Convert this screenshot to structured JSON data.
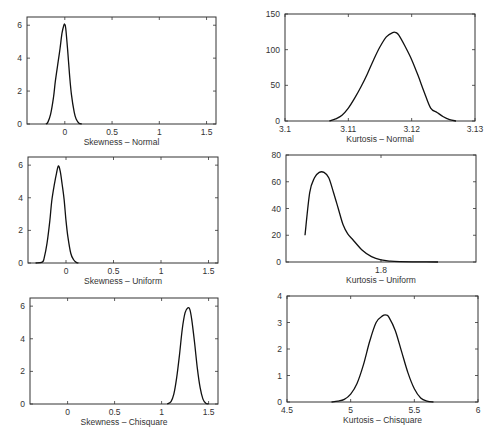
{
  "figure": {
    "layout": {
      "rows": 3,
      "cols": 2
    }
  },
  "chart_data": [
    {
      "type": "line",
      "id": "skew-normal",
      "title": "",
      "xlabel": "Skewness – Normal",
      "ylabel": "",
      "xlim": [
        -0.4,
        1.6
      ],
      "ylim": [
        0,
        6.5
      ],
      "xticks": [
        0,
        0.5,
        1,
        1.5
      ],
      "xtick_labels": [
        "0",
        "0.5",
        "1",
        "1.5"
      ],
      "yticks": [
        0,
        2,
        4,
        6
      ],
      "ytick_labels": [
        "0",
        "2",
        "4",
        "6"
      ],
      "grid": false,
      "frame": {
        "x": 27,
        "y": 17,
        "w": 189,
        "h": 107
      },
      "x": [
        -0.2,
        -0.18,
        -0.15,
        -0.12,
        -0.1,
        -0.07,
        -0.05,
        -0.03,
        -0.01,
        0.0,
        0.01,
        0.03,
        0.05,
        0.07,
        0.1,
        0.12,
        0.15,
        0.18
      ],
      "y": [
        0,
        0.1,
        0.6,
        1.6,
        2.6,
        3.8,
        4.6,
        5.5,
        6.0,
        6.05,
        5.8,
        4.5,
        3.0,
        1.8,
        0.7,
        0.3,
        0.05,
        0
      ]
    },
    {
      "type": "line",
      "id": "kurt-normal",
      "title": "",
      "xlabel": "Kurtosis – Normal",
      "ylabel": "",
      "xlim": [
        3.1,
        3.13
      ],
      "ylim": [
        0,
        150
      ],
      "xticks": [
        3.1,
        3.11,
        3.12,
        3.13
      ],
      "xtick_labels": [
        "3.1",
        "3.11",
        "3.12",
        "3.13"
      ],
      "yticks": [
        0,
        50,
        100,
        150
      ],
      "ytick_labels": [
        "0",
        "50",
        "100",
        "150"
      ],
      "grid": false,
      "frame": {
        "x": 285,
        "y": 14,
        "w": 190,
        "h": 107
      },
      "x": [
        3.107,
        3.108,
        3.109,
        3.11,
        3.111,
        3.112,
        3.113,
        3.114,
        3.115,
        3.116,
        3.117,
        3.1175,
        3.118,
        3.119,
        3.12,
        3.121,
        3.122,
        3.123,
        3.124,
        3.125,
        3.126,
        3.127
      ],
      "y": [
        0,
        3,
        8,
        18,
        32,
        48,
        66,
        86,
        104,
        118,
        124,
        124,
        120,
        104,
        86,
        64,
        40,
        18,
        12,
        6,
        2,
        0
      ]
    },
    {
      "type": "line",
      "id": "skew-uniform",
      "title": "",
      "xlabel": "Skewness – Uniform",
      "ylabel": "",
      "xlim": [
        -0.4,
        1.6
      ],
      "ylim": [
        0,
        6.5
      ],
      "xticks": [
        0,
        0.5,
        1,
        1.5
      ],
      "xtick_labels": [
        "0",
        "0.5",
        "1",
        "1.5"
      ],
      "yticks": [
        0,
        2,
        4,
        6
      ],
      "ytick_labels": [
        "0",
        "2",
        "4",
        "6"
      ],
      "grid": false,
      "frame": {
        "x": 28,
        "y": 157,
        "w": 190,
        "h": 106
      },
      "x": [
        -0.32,
        -0.25,
        -0.23,
        -0.2,
        -0.17,
        -0.15,
        -0.12,
        -0.1,
        -0.08,
        -0.06,
        -0.04,
        -0.02,
        0.0,
        0.02,
        0.05,
        0.08,
        0.11,
        0.13
      ],
      "y": [
        0,
        0.05,
        0.3,
        1.2,
        2.6,
        3.8,
        4.9,
        5.5,
        5.95,
        5.6,
        4.8,
        3.9,
        2.6,
        1.6,
        0.6,
        0.2,
        0.03,
        0
      ]
    },
    {
      "type": "line",
      "id": "kurt-uniform",
      "title": "",
      "xlabel": "Kurtosis – Uniform",
      "ylabel": "",
      "xlim": [
        1.7,
        1.9
      ],
      "ylim": [
        0,
        80
      ],
      "xticks": [
        1.8
      ],
      "xtick_labels": [
        "1.8"
      ],
      "yticks": [
        0,
        20,
        40,
        60,
        80
      ],
      "ytick_labels": [
        "0",
        "20",
        "40",
        "60",
        "80"
      ],
      "grid": false,
      "frame": {
        "x": 286,
        "y": 155,
        "w": 190,
        "h": 107
      },
      "x": [
        1.72,
        1.725,
        1.73,
        1.735,
        1.74,
        1.745,
        1.75,
        1.755,
        1.76,
        1.765,
        1.77,
        1.78,
        1.79,
        1.8,
        1.81,
        1.82,
        1.84,
        1.86
      ],
      "y": [
        20,
        52,
        63,
        67,
        67,
        63,
        52,
        40,
        28,
        21,
        17,
        9,
        4,
        1.5,
        0.6,
        0.3,
        0.1,
        0
      ]
    },
    {
      "type": "line",
      "id": "skew-chisquare",
      "title": "",
      "xlabel": "Skewness – Chisquare",
      "ylabel": "",
      "xlim": [
        -0.4,
        1.6
      ],
      "ylim": [
        0,
        6.5
      ],
      "xticks": [
        0,
        0.5,
        1,
        1.5
      ],
      "xtick_labels": [
        "0",
        "0.5",
        "1",
        "1.5"
      ],
      "yticks": [
        0,
        2,
        4,
        6
      ],
      "ytick_labels": [
        "0",
        "2",
        "4",
        "6"
      ],
      "grid": false,
      "frame": {
        "x": 30,
        "y": 298,
        "w": 188,
        "h": 106
      },
      "x": [
        1.06,
        1.1,
        1.13,
        1.16,
        1.19,
        1.22,
        1.25,
        1.28,
        1.3,
        1.32,
        1.35,
        1.38,
        1.41,
        1.44,
        1.47,
        1.5
      ],
      "y": [
        0,
        0.15,
        0.6,
        1.6,
        3.0,
        4.6,
        5.6,
        5.9,
        5.8,
        5.2,
        3.8,
        2.2,
        1.0,
        0.3,
        0.05,
        0
      ]
    },
    {
      "type": "line",
      "id": "kurt-chisquare",
      "title": "",
      "xlabel": "Kurtosis – Chisquare",
      "ylabel": "",
      "xlim": [
        4.5,
        6
      ],
      "ylim": [
        0,
        4
      ],
      "xticks": [
        4.5,
        5,
        5.5,
        6
      ],
      "xtick_labels": [
        "4.5",
        "5",
        "5.5",
        "6"
      ],
      "yticks": [
        0,
        1,
        2,
        3,
        4
      ],
      "ytick_labels": [
        "0",
        "1",
        "2",
        "3",
        "4"
      ],
      "grid": false,
      "frame": {
        "x": 287,
        "y": 296,
        "w": 191,
        "h": 106
      },
      "x": [
        4.85,
        4.9,
        4.95,
        5.0,
        5.05,
        5.1,
        5.15,
        5.2,
        5.25,
        5.28,
        5.3,
        5.35,
        5.4,
        5.45,
        5.5,
        5.55,
        5.6,
        5.65
      ],
      "y": [
        0,
        0.03,
        0.1,
        0.3,
        0.7,
        1.4,
        2.3,
        3.0,
        3.25,
        3.28,
        3.2,
        2.7,
        1.9,
        1.1,
        0.5,
        0.15,
        0.03,
        0
      ]
    }
  ]
}
